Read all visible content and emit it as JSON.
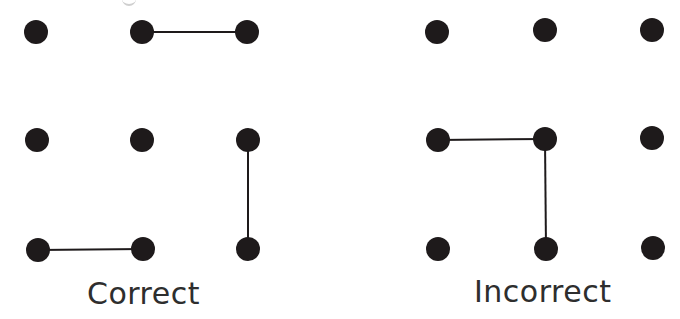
{
  "colors": {
    "background": "#ffffff",
    "dot": "#1e1a1b",
    "line": "#1e1a1b",
    "text": "#2e2e2e"
  },
  "dot_radius": 12,
  "line_width": 2,
  "grids": [
    {
      "name": "correct",
      "caption": "Correct",
      "dots": [
        {
          "row": 0,
          "col": 0,
          "x": 36,
          "y": 32
        },
        {
          "row": 0,
          "col": 1,
          "x": 142,
          "y": 32
        },
        {
          "row": 0,
          "col": 2,
          "x": 247,
          "y": 32
        },
        {
          "row": 1,
          "col": 0,
          "x": 37,
          "y": 140
        },
        {
          "row": 1,
          "col": 1,
          "x": 142,
          "y": 140
        },
        {
          "row": 1,
          "col": 2,
          "x": 248,
          "y": 140
        },
        {
          "row": 2,
          "col": 0,
          "x": 38,
          "y": 250
        },
        {
          "row": 2,
          "col": 1,
          "x": 143,
          "y": 249
        },
        {
          "row": 2,
          "col": 2,
          "x": 248,
          "y": 249
        }
      ],
      "lines": [
        {
          "from": [
            0,
            1
          ],
          "to": [
            0,
            2
          ]
        },
        {
          "from": [
            1,
            2
          ],
          "to": [
            2,
            2
          ]
        },
        {
          "from": [
            2,
            0
          ],
          "to": [
            2,
            1
          ]
        }
      ]
    },
    {
      "name": "incorrect",
      "caption": "Incorrect",
      "dots": [
        {
          "row": 0,
          "col": 0,
          "x": 437,
          "y": 32
        },
        {
          "row": 0,
          "col": 1,
          "x": 545,
          "y": 30
        },
        {
          "row": 0,
          "col": 2,
          "x": 652,
          "y": 30
        },
        {
          "row": 1,
          "col": 0,
          "x": 438,
          "y": 140
        },
        {
          "row": 1,
          "col": 1,
          "x": 545,
          "y": 139
        },
        {
          "row": 1,
          "col": 2,
          "x": 652,
          "y": 138
        },
        {
          "row": 2,
          "col": 0,
          "x": 438,
          "y": 249
        },
        {
          "row": 2,
          "col": 1,
          "x": 546,
          "y": 249
        },
        {
          "row": 2,
          "col": 2,
          "x": 653,
          "y": 248
        }
      ],
      "lines": [
        {
          "from": [
            1,
            0
          ],
          "to": [
            1,
            1
          ]
        },
        {
          "from": [
            1,
            1
          ],
          "to": [
            2,
            1
          ]
        }
      ]
    }
  ],
  "captions": {
    "correct": "Correct",
    "incorrect": "Incorrect"
  }
}
